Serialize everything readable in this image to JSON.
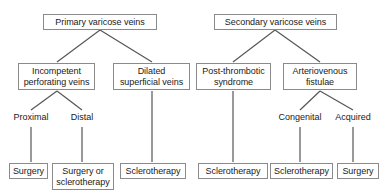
{
  "diagram": {
    "type": "flowchart-tree",
    "line_color": "#555555",
    "box_border_color": "#8a8a8a",
    "text_color": "#1a1a1a",
    "background": "#ffffff",
    "nodes": [
      {
        "id": "primary",
        "label": "Primary varicose veins",
        "kind": "box",
        "level": 1,
        "x": 43,
        "y": 14,
        "w": 114,
        "h": 16
      },
      {
        "id": "secondary",
        "label": "Secondary varicose veins",
        "kind": "box",
        "level": 1,
        "x": 214,
        "y": 14,
        "w": 123,
        "h": 16
      },
      {
        "id": "incompetent",
        "label": "Incompetent\nperforating veins",
        "kind": "box",
        "level": 2,
        "x": 18,
        "y": 63,
        "w": 77,
        "h": 27
      },
      {
        "id": "dilated",
        "label": "Dilated\nsuperficial veins",
        "kind": "box",
        "level": 2,
        "x": 113,
        "y": 63,
        "w": 77,
        "h": 27
      },
      {
        "id": "postthrombotic",
        "label": "Post-thrombotic\nsyndrome",
        "kind": "box",
        "level": 2,
        "x": 196,
        "y": 63,
        "w": 75,
        "h": 27
      },
      {
        "id": "avfistulae",
        "label": "Arteriovenous\nfistulae",
        "kind": "box",
        "level": 2,
        "x": 283,
        "y": 63,
        "w": 74,
        "h": 27
      },
      {
        "id": "proximal",
        "label": "Proximal",
        "kind": "label",
        "level": 3,
        "x": 8,
        "y": 112,
        "w": 46,
        "h": 12
      },
      {
        "id": "distal",
        "label": "Distal",
        "kind": "label",
        "level": 3,
        "x": 65,
        "y": 112,
        "w": 34,
        "h": 12
      },
      {
        "id": "congenital",
        "label": "Congenital",
        "kind": "label",
        "level": 3,
        "x": 273,
        "y": 112,
        "w": 54,
        "h": 12
      },
      {
        "id": "acquired",
        "label": "Acquired",
        "kind": "label",
        "level": 3,
        "x": 330,
        "y": 112,
        "w": 46,
        "h": 12
      },
      {
        "id": "surgery1",
        "label": "Surgery",
        "kind": "box",
        "level": 4,
        "x": 9,
        "y": 163,
        "w": 39,
        "h": 16
      },
      {
        "id": "surgeryorsclero",
        "label": "Surgery or\nsclerotherapy",
        "kind": "box",
        "level": 4,
        "x": 52,
        "y": 163,
        "w": 62,
        "h": 27
      },
      {
        "id": "sclero1",
        "label": "Sclerotherapy",
        "kind": "box",
        "level": 4,
        "x": 120,
        "y": 163,
        "w": 66,
        "h": 16
      },
      {
        "id": "sclero2",
        "label": "Sclerotherapy",
        "kind": "box",
        "level": 4,
        "x": 198,
        "y": 163,
        "w": 70,
        "h": 16
      },
      {
        "id": "sclero3",
        "label": "Sclerotherapy",
        "kind": "box",
        "level": 4,
        "x": 270,
        "y": 163,
        "w": 63,
        "h": 16
      },
      {
        "id": "surgery2",
        "label": "Surgery",
        "kind": "box",
        "level": 4,
        "x": 337,
        "y": 163,
        "w": 42,
        "h": 16
      }
    ],
    "edges": [
      {
        "from": "primary",
        "to": "incompetent",
        "x1": 100,
        "y1": 30,
        "x2": 57,
        "y2": 62
      },
      {
        "from": "primary",
        "to": "dilated",
        "x1": 100,
        "y1": 30,
        "x2": 152,
        "y2": 62
      },
      {
        "from": "secondary",
        "to": "postthrombotic",
        "x1": 275,
        "y1": 30,
        "x2": 233,
        "y2": 62
      },
      {
        "from": "secondary",
        "to": "avfistulae",
        "x1": 275,
        "y1": 30,
        "x2": 320,
        "y2": 62
      },
      {
        "from": "incompetent",
        "to": "proximal",
        "x1": 57,
        "y1": 91,
        "x2": 31,
        "y2": 110
      },
      {
        "from": "incompetent",
        "to": "distal",
        "x1": 57,
        "y1": 91,
        "x2": 82,
        "y2": 110
      },
      {
        "from": "avfistulae",
        "to": "congenital",
        "x1": 320,
        "y1": 91,
        "x2": 300,
        "y2": 110
      },
      {
        "from": "avfistulae",
        "to": "acquired",
        "x1": 320,
        "y1": 91,
        "x2": 353,
        "y2": 110
      },
      {
        "from": "proximal",
        "to": "surgery1",
        "x1": 31,
        "y1": 127,
        "x2": 31,
        "y2": 162
      },
      {
        "from": "distal",
        "to": "surgeryorsclero",
        "x1": 82,
        "y1": 127,
        "x2": 82,
        "y2": 162
      },
      {
        "from": "dilated",
        "to": "sclero1",
        "x1": 152,
        "y1": 91,
        "x2": 152,
        "y2": 162
      },
      {
        "from": "postthrombotic",
        "to": "sclero2",
        "x1": 233,
        "y1": 91,
        "x2": 233,
        "y2": 162
      },
      {
        "from": "congenital",
        "to": "sclero3",
        "x1": 300,
        "y1": 127,
        "x2": 300,
        "y2": 162
      },
      {
        "from": "acquired",
        "to": "surgery2",
        "x1": 353,
        "y1": 127,
        "x2": 353,
        "y2": 162
      }
    ]
  }
}
